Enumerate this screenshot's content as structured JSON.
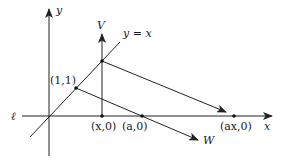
{
  "diagram": {
    "type": "geometric-construction",
    "labels": {
      "y_axis": "y",
      "x_axis": "x",
      "line_l": "ℓ",
      "line_yx": "y = x",
      "V": "V",
      "W": "W",
      "point_11": "(1,1)",
      "point_x0": "(x,0)",
      "point_a0": "(a,0)",
      "point_ax0": "(ax,0)"
    },
    "colors": {
      "stroke": "#222222",
      "text": "#1a1a1a",
      "background": "#ffffff"
    }
  }
}
